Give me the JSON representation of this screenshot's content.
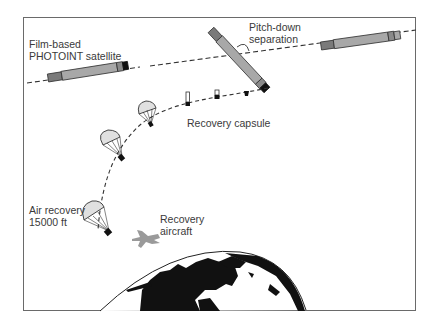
{
  "figure": {
    "labels": {
      "satellite_line1": "Film-based",
      "satellite_line2": "PHOTOINT satellite",
      "pitch_line1": "Pitch-down",
      "pitch_line2": "separation",
      "capsule": "Recovery capsule",
      "air_recovery_line1": "Air recovery",
      "air_recovery_line2": "15000 ft",
      "aircraft_line1": "Recovery",
      "aircraft_line2": "aircraft"
    },
    "colors": {
      "frame": "#6a6a6a",
      "satellite_body": "#a8a8a8",
      "satellite_dark": "#7a7a7a",
      "parachute_fill": "#e0e0e0",
      "aircraft": "#9a9a9a",
      "earth_land": "#111111",
      "text": "#3a3a3a"
    },
    "elements": [
      {
        "name": "orbit-path",
        "type": "dashed-line"
      },
      {
        "name": "descent-path",
        "type": "dashed-curve"
      },
      {
        "name": "satellite-left",
        "type": "satellite"
      },
      {
        "name": "satellite-pitching",
        "type": "satellite"
      },
      {
        "name": "satellite-right",
        "type": "satellite"
      },
      {
        "name": "capsule-sequence",
        "count": 3
      },
      {
        "name": "parachute-sequence",
        "count": 3
      },
      {
        "name": "recovery-aircraft",
        "type": "aircraft"
      },
      {
        "name": "earth",
        "type": "globe"
      }
    ]
  }
}
